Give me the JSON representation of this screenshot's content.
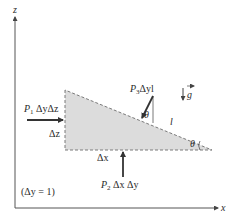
{
  "diagram": {
    "axes": {
      "z_label": "z",
      "x_label": "x"
    },
    "gravity": {
      "label": "g",
      "icon": "down-arrow-icon"
    },
    "element": {
      "shape": "right-triangle",
      "fill": "#dcdcdc",
      "border": "#7a7a7a",
      "side_labels": {
        "vertical": "Δz",
        "horizontal": "Δx",
        "hypotenuse": "l"
      },
      "angle_labels": {
        "at_pressure_arrow": "θ",
        "at_corner": "θ"
      }
    },
    "forces": [
      {
        "id": "P1",
        "symbol": "P",
        "subscript": "1",
        "rest": " ΔyΔz",
        "direction": "right"
      },
      {
        "id": "P2",
        "symbol": "P",
        "subscript": "2",
        "rest": " Δx Δy",
        "direction": "up"
      },
      {
        "id": "P3",
        "symbol": "P",
        "subscript": "3",
        "rest": "Δyl",
        "direction": "down-left"
      }
    ],
    "note": "(Δy = 1)",
    "colors": {
      "axis": "#555555",
      "arrow": "#333333",
      "text": "#2a2a2a"
    }
  }
}
